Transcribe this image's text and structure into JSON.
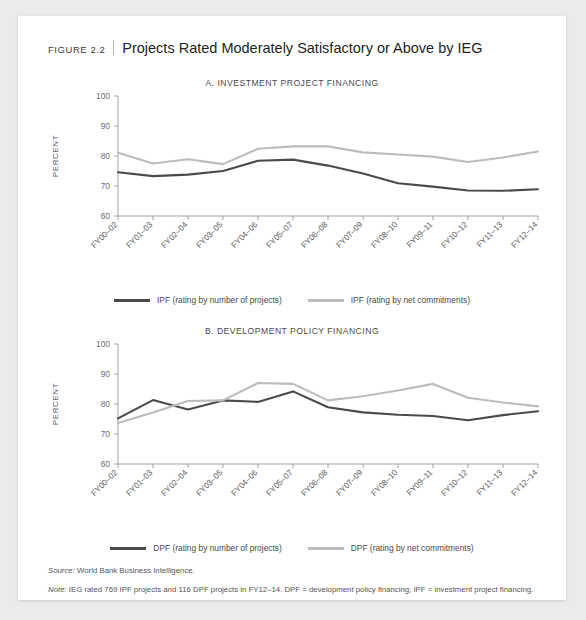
{
  "figure": {
    "number": "FIGURE 2.2",
    "title": "Projects Rated Moderately Satisfactory or Above by IEG"
  },
  "colors": {
    "series_dark": "#4a4a4a",
    "series_light": "#bcbcbc",
    "axis": "#9a9a9a",
    "card": "#ffffff",
    "page": "#eceaea"
  },
  "footnotes": {
    "source_lead": "Source:",
    "source_text": " World Bank Business Intelligence.",
    "note_lead": "Note:",
    "note_text": " IEG rated 769 IPF projects and 116 DPF projects in FY12–14. DPF = development policy financing; IPF = investment project financing."
  },
  "chart_data": [
    {
      "type": "line",
      "title": "A. INVESTMENT PROJECT FINANCING",
      "xlabel": "",
      "ylabel": "PERCENT",
      "ylim": [
        60,
        100
      ],
      "yticks": [
        60,
        70,
        80,
        90,
        100
      ],
      "grid": false,
      "legend_position": "bottom",
      "categories": [
        "FY00–02",
        "FY01–03",
        "FY02–04",
        "FY03–05",
        "FY04–06",
        "FY05–07",
        "FY06–08",
        "FY07–09",
        "FY08–10",
        "FY09–11",
        "FY10–12",
        "FY11–13",
        "FY12–14"
      ],
      "series": [
        {
          "name": "IPF (rating by number of projects)",
          "color": "#4a4a4a",
          "values": [
            74.6,
            73.3,
            73.8,
            75.0,
            78.4,
            78.8,
            76.8,
            74.2,
            70.9,
            69.8,
            68.5,
            68.4,
            68.9
          ]
        },
        {
          "name": "IPF (rating by net commitments)",
          "color": "#bcbcbc",
          "values": [
            81.1,
            77.5,
            78.9,
            77.3,
            82.4,
            83.2,
            83.2,
            81.2,
            80.5,
            79.8,
            78.0,
            79.5,
            81.5
          ]
        }
      ]
    },
    {
      "type": "line",
      "title": "B. DEVELOPMENT POLICY FINANCING",
      "xlabel": "",
      "ylabel": "PERCENT",
      "ylim": [
        60,
        100
      ],
      "yticks": [
        60,
        70,
        80,
        90,
        100
      ],
      "grid": false,
      "legend_position": "bottom",
      "categories": [
        "FY00–02",
        "FY01–03",
        "FY02–04",
        "FY03–05",
        "FY04–06",
        "FY05–07",
        "FY06–08",
        "FY07–09",
        "FY08–10",
        "FY09–11",
        "FY10–12",
        "FY11–13",
        "FY12–14"
      ],
      "series": [
        {
          "name": "DPF (rating by number of projects)",
          "color": "#4a4a4a",
          "values": [
            75.2,
            81.3,
            78.2,
            81.2,
            80.7,
            84.2,
            78.9,
            77.2,
            76.4,
            76.0,
            74.6,
            76.3,
            77.6
          ]
        },
        {
          "name": "DPF (rating by net commitments)",
          "color": "#bcbcbc",
          "values": [
            73.7,
            77.2,
            81.0,
            81.2,
            87.0,
            86.7,
            81.2,
            82.6,
            84.5,
            86.7,
            82.1,
            80.5,
            79.2
          ]
        }
      ]
    }
  ]
}
